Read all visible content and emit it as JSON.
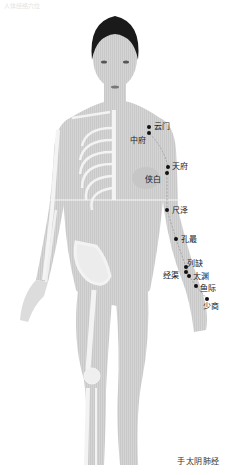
{
  "header_faint": "人体经络穴位",
  "caption": "手太阴肺经",
  "meridian": {
    "name": "手太阴肺经",
    "line_color": "#9a9a9a",
    "dot_color": "#111111"
  },
  "points": [
    {
      "name": "云门",
      "dot": [
        149,
        127
      ],
      "label": [
        154,
        122
      ]
    },
    {
      "name": "中府",
      "dot": [
        149,
        133
      ],
      "label": [
        130,
        136
      ]
    },
    {
      "name": "天府",
      "dot": [
        168,
        167
      ],
      "label": [
        172,
        162
      ]
    },
    {
      "name": "侠白",
      "dot": [
        167,
        173
      ],
      "label": [
        145,
        175
      ]
    },
    {
      "name": "尺泽",
      "dot": [
        167,
        210
      ],
      "label": [
        172,
        206
      ]
    },
    {
      "name": "孔最",
      "dot": [
        176,
        239
      ],
      "label": [
        181,
        235
      ]
    },
    {
      "name": "列缺",
      "dot": [
        186,
        267
      ],
      "label": [
        187,
        259
      ]
    },
    {
      "name": "经渠",
      "dot": [
        186,
        272
      ],
      "label": [
        163,
        271
      ]
    },
    {
      "name": "太渊",
      "dot": [
        189,
        276
      ],
      "label": [
        193,
        272
      ]
    },
    {
      "name": "鱼际",
      "dot": [
        196,
        286
      ],
      "label": [
        200,
        284
      ]
    },
    {
      "name": "少商",
      "dot": [
        207,
        299
      ],
      "label": [
        203,
        302
      ]
    }
  ],
  "colors": {
    "skin": "#d2d2d2",
    "skin_shadow": "#bcbcbc",
    "bone": "#f2f2f2",
    "hair": "#1a1a1a",
    "background": "#ffffff"
  }
}
